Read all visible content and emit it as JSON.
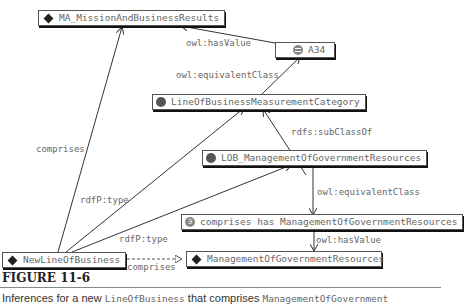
{
  "nodes": {
    "mission": {
      "label": "MA_MissionAndBusinessResults",
      "icon": "diamond"
    },
    "a34": {
      "label": "A34",
      "icon": "circle-equals"
    },
    "lobmc": {
      "label": "LineOfBusinessMeasurementCategory",
      "icon": "circle"
    },
    "lobmgr": {
      "label": "LOB_ManagementOfGovernmentResources",
      "icon": "circle"
    },
    "restriction": {
      "label": "comprises has ManagementOfGovernmentResources",
      "icon": "circle-restriction"
    },
    "newlob": {
      "label": "NewLineOfBusiness",
      "icon": "diamond"
    },
    "mgr": {
      "label": "ManagementOfGovernmentResources",
      "icon": "diamond"
    }
  },
  "edges": {
    "a34_to_mission": "owl:hasValue",
    "lobmc_to_a34": "owl:equivalentClass",
    "lobmgr_to_lobmc": "rdfs:subClassOf",
    "lobmgr_to_restriction": "owl:equivalentClass",
    "restriction_to_mgr": "owl:hasValue",
    "newlob_to_mission": "comprises",
    "newlob_to_lobmc": "rdfP:type",
    "newlob_to_lobmgr": "rdfP:type",
    "newlob_to_mgr": "comprises"
  },
  "figure": {
    "title": "FIGURE 11-6",
    "caption_part1": "Inferences for a new ",
    "caption_code1": "LineOfBusiness",
    "caption_part2": " that comprises ",
    "caption_code2": "ManagementOfGovernment"
  }
}
